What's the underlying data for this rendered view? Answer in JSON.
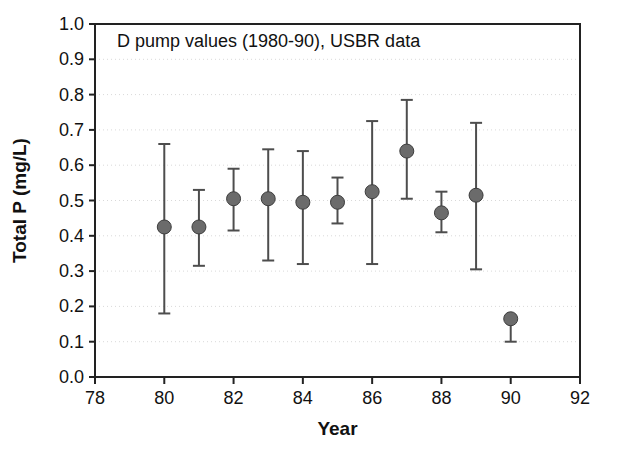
{
  "chart_data": {
    "type": "scatter",
    "title": "D pump values (1980-90), USBR data",
    "xlabel": "Year",
    "ylabel": "Total P (mg/L)",
    "xlim": [
      78,
      92
    ],
    "ylim": [
      0.0,
      1.0
    ],
    "xticks": [
      "78",
      "80",
      "82",
      "84",
      "86",
      "88",
      "90",
      "92"
    ],
    "xtick_values": [
      78,
      80,
      82,
      84,
      86,
      88,
      90,
      92
    ],
    "yticks": [
      "0.0",
      "0.1",
      "0.2",
      "0.3",
      "0.4",
      "0.5",
      "0.6",
      "0.7",
      "0.8",
      "0.9",
      "1.0"
    ],
    "ytick_values": [
      0.0,
      0.1,
      0.2,
      0.3,
      0.4,
      0.5,
      0.6,
      0.7,
      0.8,
      0.9,
      1.0
    ],
    "grid": true,
    "grid_axis": "y",
    "legend": "none",
    "marker": "filled-circle",
    "marker_color": "#6b6b6b",
    "errorbar_color": "#4d4d4d",
    "axis_color": "#222222",
    "x": [
      80,
      81,
      82,
      83,
      84,
      85,
      86,
      87,
      88,
      89,
      90
    ],
    "values": [
      0.425,
      0.425,
      0.505,
      0.505,
      0.495,
      0.495,
      0.525,
      0.64,
      0.465,
      0.515,
      0.165
    ],
    "err_low": [
      0.18,
      0.315,
      0.415,
      0.33,
      0.32,
      0.435,
      0.32,
      0.505,
      0.41,
      0.305,
      0.1
    ],
    "err_high": [
      0.66,
      0.53,
      0.59,
      0.645,
      0.64,
      0.565,
      0.725,
      0.785,
      0.525,
      0.72,
      0.165
    ],
    "points": [
      {
        "year": 80,
        "value": 0.425,
        "low": 0.18,
        "high": 0.66
      },
      {
        "year": 81,
        "value": 0.425,
        "low": 0.315,
        "high": 0.53
      },
      {
        "year": 82,
        "value": 0.505,
        "low": 0.415,
        "high": 0.59
      },
      {
        "year": 83,
        "value": 0.505,
        "low": 0.33,
        "high": 0.645
      },
      {
        "year": 84,
        "value": 0.495,
        "low": 0.32,
        "high": 0.64
      },
      {
        "year": 85,
        "value": 0.495,
        "low": 0.435,
        "high": 0.565
      },
      {
        "year": 86,
        "value": 0.525,
        "low": 0.32,
        "high": 0.725
      },
      {
        "year": 87,
        "value": 0.64,
        "low": 0.505,
        "high": 0.785
      },
      {
        "year": 88,
        "value": 0.465,
        "low": 0.41,
        "high": 0.525
      },
      {
        "year": 89,
        "value": 0.515,
        "low": 0.305,
        "high": 0.72
      },
      {
        "year": 90,
        "value": 0.165,
        "low": 0.1,
        "high": 0.165
      }
    ]
  },
  "layout": {
    "plot_left": 95,
    "plot_right": 580,
    "plot_top": 24,
    "plot_bottom": 377,
    "marker_radius": 7,
    "cap_half_width": 6
  }
}
